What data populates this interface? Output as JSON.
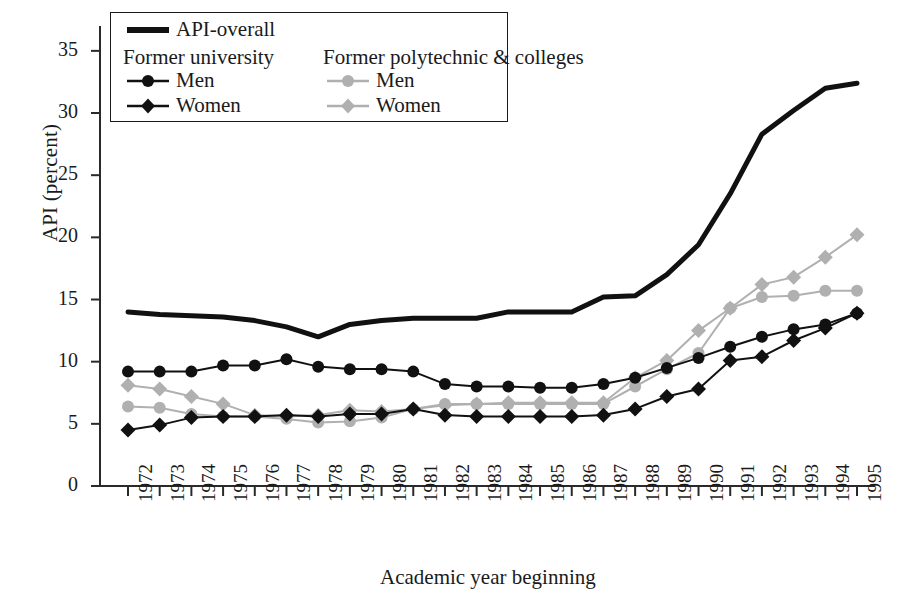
{
  "chart_data": {
    "type": "line",
    "title": "",
    "xlabel": "Academic year beginning",
    "ylabel": "API (percent)",
    "categories": [
      "1972",
      "1973",
      "1974",
      "1975",
      "1976",
      "1977",
      "1978",
      "1979",
      "1980",
      "1981",
      "1982",
      "1983",
      "1984",
      "1985",
      "1986",
      "1987",
      "1988",
      "1989",
      "1990",
      "1991",
      "1992",
      "1993",
      "1994",
      "1995"
    ],
    "ylim": [
      0,
      37
    ],
    "yticks": [
      0,
      5,
      10,
      15,
      20,
      25,
      30,
      35
    ],
    "grid": false,
    "legend_position": "top-left-inside",
    "series": [
      {
        "name": "API-overall",
        "group": "overall",
        "marker": "none",
        "color": "#111111",
        "line_width": 5,
        "values": [
          14.0,
          13.8,
          13.7,
          13.6,
          13.3,
          12.8,
          12.0,
          13.0,
          13.3,
          13.5,
          13.5,
          13.5,
          14.0,
          14.0,
          14.0,
          15.2,
          15.3,
          17.0,
          19.4,
          23.5,
          28.3,
          30.2,
          32.0,
          32.4
        ]
      },
      {
        "name": "Men",
        "group": "Former university",
        "marker": "circle",
        "color": "#111111",
        "line_width": 2,
        "values": [
          9.2,
          9.2,
          9.2,
          9.7,
          9.7,
          10.2,
          9.6,
          9.4,
          9.4,
          9.2,
          8.2,
          8.0,
          8.0,
          7.9,
          7.9,
          8.2,
          8.7,
          9.5,
          10.3,
          11.2,
          12.0,
          12.6,
          13.0,
          13.9
        ]
      },
      {
        "name": "Women",
        "group": "Former university",
        "marker": "diamond",
        "color": "#111111",
        "line_width": 2,
        "values": [
          4.5,
          4.9,
          5.5,
          5.6,
          5.6,
          5.7,
          5.6,
          5.8,
          5.8,
          6.2,
          5.7,
          5.6,
          5.6,
          5.6,
          5.6,
          5.7,
          6.2,
          7.2,
          7.8,
          10.1,
          10.4,
          11.7,
          12.7,
          13.9
        ]
      },
      {
        "name": "Men",
        "group": "Former polytechnic & colleges",
        "marker": "circle",
        "color": "#b0b0b0",
        "line_width": 2,
        "values": [
          6.4,
          6.3,
          5.8,
          5.6,
          5.6,
          5.4,
          5.1,
          5.2,
          5.5,
          6.2,
          6.6,
          6.6,
          6.6,
          6.6,
          6.6,
          6.6,
          8.0,
          9.4,
          10.7,
          14.3,
          15.2,
          15.3,
          15.7,
          15.7
        ]
      },
      {
        "name": "Women",
        "group": "Former polytechnic & colleges",
        "marker": "diamond",
        "color": "#b0b0b0",
        "line_width": 2,
        "values": [
          8.1,
          7.8,
          7.2,
          6.6,
          5.7,
          5.6,
          5.7,
          6.1,
          6.0,
          6.2,
          6.5,
          6.6,
          6.7,
          6.7,
          6.7,
          6.7,
          8.7,
          10.1,
          12.5,
          14.3,
          16.2,
          16.8,
          18.4,
          20.2
        ]
      }
    ]
  },
  "legend": {
    "overall_label": "API-overall",
    "group1_heading": "Former university",
    "group1_men": "Men",
    "group1_women": "Women",
    "group2_heading": "Former polytechnic & colleges",
    "group2_men": "Men",
    "group2_women": "Women"
  },
  "colors": {
    "dark": "#111111",
    "light": "#b0b0b0",
    "axis": "#2a2a2a",
    "background": "#ffffff"
  }
}
